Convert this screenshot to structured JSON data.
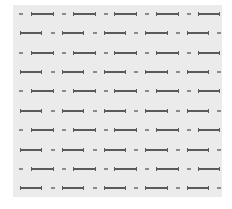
{
  "canvas": {
    "width": 232,
    "height": 209,
    "background": "#ffffff"
  },
  "panel": {
    "left": 13,
    "top": 5,
    "width": 209,
    "height": 192,
    "background": "#ebebeb"
  },
  "pattern": {
    "line_color": "#5a5a5a",
    "dash_color": "#8a8a8a",
    "row_y": [
      14,
      33,
      53,
      72,
      91,
      111,
      130,
      150,
      169,
      188
    ],
    "row_types": [
      "A",
      "B",
      "A",
      "B",
      "A",
      "B",
      "A",
      "B",
      "A",
      "B"
    ],
    "row_A": [
      {
        "kind": "short",
        "x1": 19,
        "x2": 23
      },
      {
        "kind": "long",
        "x1": 31,
        "x2": 54
      },
      {
        "kind": "short",
        "x1": 62,
        "x2": 66
      },
      {
        "kind": "long",
        "x1": 73,
        "x2": 96
      },
      {
        "kind": "short",
        "x1": 104,
        "x2": 108
      },
      {
        "kind": "long",
        "x1": 114,
        "x2": 137
      },
      {
        "kind": "short",
        "x1": 145,
        "x2": 149
      },
      {
        "kind": "long",
        "x1": 156,
        "x2": 179
      },
      {
        "kind": "short",
        "x1": 187,
        "x2": 191
      },
      {
        "kind": "long",
        "x1": 198,
        "x2": 220
      }
    ],
    "row_B": [
      {
        "kind": "long",
        "x1": 20,
        "x2": 42
      },
      {
        "kind": "short",
        "x1": 51,
        "x2": 55
      },
      {
        "kind": "long",
        "x1": 62,
        "x2": 84
      },
      {
        "kind": "short",
        "x1": 93,
        "x2": 97
      },
      {
        "kind": "long",
        "x1": 104,
        "x2": 126
      },
      {
        "kind": "short",
        "x1": 134,
        "x2": 138
      },
      {
        "kind": "long",
        "x1": 145,
        "x2": 168
      },
      {
        "kind": "short",
        "x1": 176,
        "x2": 180
      },
      {
        "kind": "long",
        "x1": 187,
        "x2": 209
      },
      {
        "kind": "short",
        "x1": 217,
        "x2": 221
      }
    ]
  }
}
